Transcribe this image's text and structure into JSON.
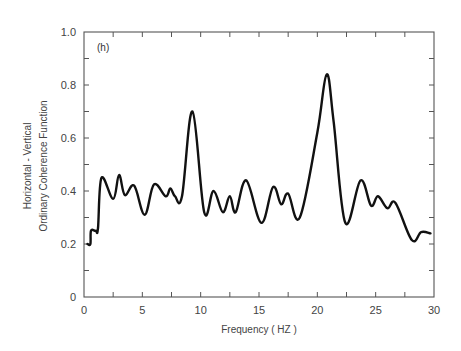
{
  "chart_data": {
    "type": "line",
    "title": "",
    "panel_label": "(h)",
    "xlabel": "Frequency ( HZ )",
    "ylabel_lines": [
      "Horizontal  -  Vertical",
      "Ordinary  Coherence  Function"
    ],
    "xlim": [
      0,
      30
    ],
    "ylim": [
      0,
      1.0
    ],
    "x_ticks": [
      0,
      5,
      10,
      15,
      20,
      25,
      30
    ],
    "x_tick_labels": [
      "0",
      "5",
      "10",
      "15",
      "20",
      "25",
      "30"
    ],
    "x_minor_step": 2.5,
    "y_ticks": [
      0,
      0.2,
      0.4,
      0.6,
      0.8,
      1.0
    ],
    "y_tick_labels": [
      "0",
      "0.2",
      "0.4",
      "0.6",
      "0.8",
      "1.0"
    ],
    "y_minor_step": 0.1,
    "grid": false,
    "legend": null,
    "series": [
      {
        "name": "Horizontal - Vertical ordinary coherence",
        "color": "#111111",
        "x": [
          0.3,
          0.55,
          0.6,
          1.0,
          1.2,
          1.5,
          2.5,
          3.0,
          3.5,
          4.3,
          5.2,
          6.0,
          7.0,
          7.4,
          7.8,
          8.4,
          9.3,
          10.3,
          11.1,
          11.9,
          12.5,
          13.0,
          13.9,
          15.2,
          16.2,
          16.9,
          17.5,
          18.5,
          20.0,
          20.8,
          21.4,
          22.4,
          23.7,
          24.6,
          25.2,
          26.0,
          26.7,
          28.1,
          28.9,
          29.7
        ],
        "y": [
          0.2,
          0.2,
          0.25,
          0.25,
          0.26,
          0.45,
          0.37,
          0.46,
          0.385,
          0.42,
          0.31,
          0.425,
          0.38,
          0.41,
          0.38,
          0.38,
          0.7,
          0.32,
          0.4,
          0.32,
          0.38,
          0.32,
          0.44,
          0.28,
          0.415,
          0.35,
          0.39,
          0.3,
          0.62,
          0.84,
          0.66,
          0.28,
          0.44,
          0.345,
          0.38,
          0.335,
          0.355,
          0.215,
          0.245,
          0.24
        ]
      }
    ]
  }
}
